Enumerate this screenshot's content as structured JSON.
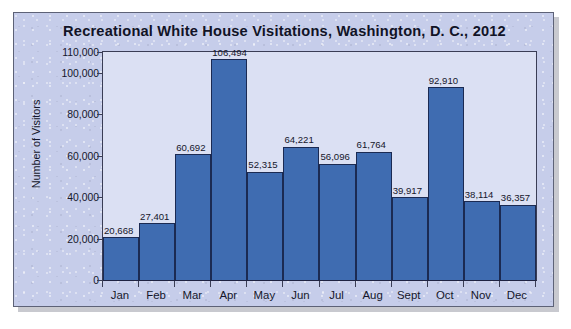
{
  "chart_data": {
    "type": "bar",
    "title": "Recreational White House Visitations, Washington, D. C., 2012",
    "xlabel": "",
    "ylabel": "Number of Visitors",
    "categories": [
      "Jan",
      "Feb",
      "Mar",
      "Apr",
      "May",
      "Jun",
      "Jul",
      "Aug",
      "Sept",
      "Oct",
      "Nov",
      "Dec"
    ],
    "values": [
      20668,
      27401,
      60692,
      106494,
      52315,
      64221,
      56096,
      61764,
      39917,
      92910,
      38114,
      36357
    ],
    "value_labels": [
      "20,668",
      "27,401",
      "60,692",
      "106,494",
      "52,315",
      "64,221",
      "56,096",
      "61,764",
      "39,917",
      "92,910",
      "38,114",
      "36,357"
    ],
    "ylim": [
      0,
      110000
    ],
    "yticks": [
      0,
      20000,
      40000,
      60000,
      80000,
      100000,
      110000
    ],
    "ytick_labels": [
      "0",
      "20,000",
      "40,000",
      "60,000",
      "80,000",
      "100,000",
      "110,000"
    ],
    "grid": false,
    "legend": false,
    "bar_color": "#3f6cb1",
    "bar_edge_color": "#1b2a52",
    "plot_background": "#dbe0f3",
    "panel_background": "#c6cdea",
    "text_color": "#15172b"
  }
}
